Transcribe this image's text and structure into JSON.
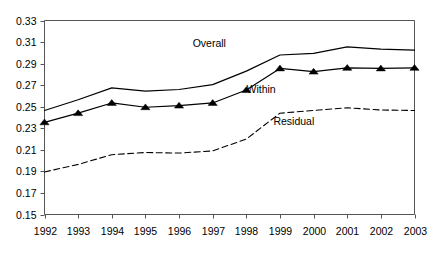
{
  "chart_data": {
    "type": "line",
    "title": "",
    "xlabel": "",
    "ylabel": "",
    "categories": [
      1992,
      1993,
      1994,
      1995,
      1996,
      1997,
      1998,
      1999,
      2000,
      2001,
      2002,
      2003
    ],
    "x_tick_labels": [
      "1992",
      "1993",
      "1994",
      "1995",
      "1996",
      "1997",
      "1998",
      "1999",
      "2000",
      "2001",
      "2002",
      "2003"
    ],
    "y_tick_labels": [
      "0.33",
      "0.31",
      "0.29",
      "0.27",
      "0.25",
      "0.23",
      "0.21",
      "0.19",
      "0.17",
      "0.15"
    ],
    "y_ticks": [
      0.33,
      0.31,
      0.29,
      0.27,
      0.25,
      0.23,
      0.21,
      0.19,
      0.17,
      0.15
    ],
    "ylim": [
      0.15,
      0.33
    ],
    "xlim": [
      1992,
      2003
    ],
    "grid": false,
    "legend_position": "inline-annotations",
    "series": [
      {
        "name": "Overall",
        "style": "solid",
        "marker": "none",
        "color": "#000000",
        "label_text": "Overall",
        "values": [
          0.2465,
          0.2565,
          0.2675,
          0.2645,
          0.266,
          0.2705,
          0.283,
          0.298,
          0.2995,
          0.3055,
          0.3035,
          0.3025
        ]
      },
      {
        "name": "Within",
        "style": "solid",
        "marker": "triangle",
        "color": "#000000",
        "label_text": "Within",
        "values": [
          0.2355,
          0.244,
          0.2535,
          0.2495,
          0.251,
          0.2535,
          0.2655,
          0.2855,
          0.2825,
          0.286,
          0.2855,
          0.286
        ]
      },
      {
        "name": "Residual",
        "style": "dashed",
        "marker": "none",
        "color": "#000000",
        "label_text": "Residual",
        "values": [
          0.1895,
          0.1965,
          0.2055,
          0.2075,
          0.207,
          0.209,
          0.22,
          0.244,
          0.2465,
          0.249,
          0.247,
          0.2465
        ]
      }
    ],
    "annotations": [
      {
        "text": "Overall",
        "x": 1997.0,
        "y": 0.3085
      },
      {
        "text": "Within",
        "x": 1998.6,
        "y": 0.2655
      },
      {
        "text": "Residual",
        "x": 1999.4,
        "y": 0.2355
      }
    ]
  }
}
